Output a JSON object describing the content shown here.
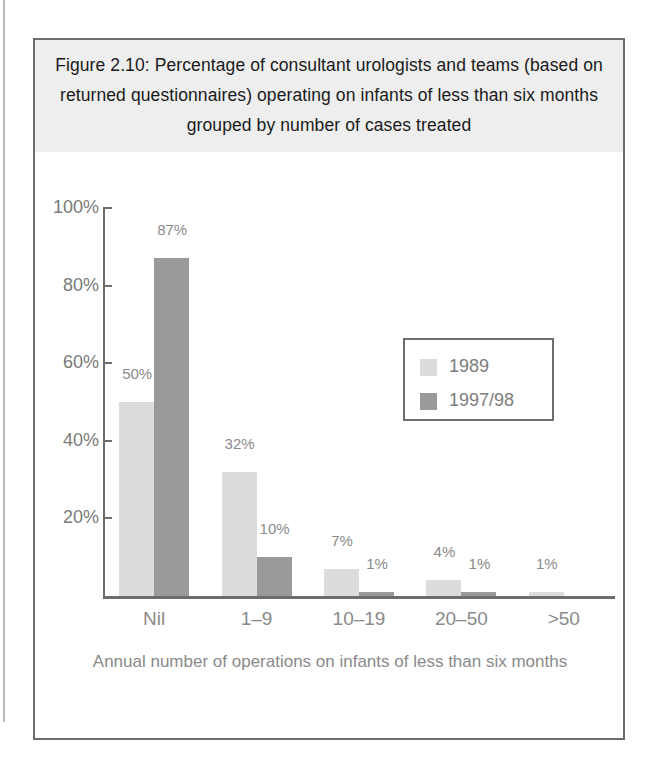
{
  "figure": {
    "title": "Figure 2.10: Percentage of consultant urologists and teams (based on returned questionnaires) operating on infants of less than six months grouped by number of cases treated"
  },
  "chart_data": {
    "type": "bar",
    "title": "Figure 2.10: Percentage of consultant urologists and teams (based on returned questionnaires) operating on infants of less than six months grouped by number of cases treated",
    "xlabel": "Annual number of operations on infants of less than six months",
    "ylabel": "",
    "ylim": [
      0,
      100
    ],
    "grid": false,
    "legend_position": "inside-upper-right",
    "categories": [
      "Nil",
      "1–9",
      "10–19",
      "20–50",
      ">50"
    ],
    "series": [
      {
        "name": "1989",
        "color": "#dcdcdc",
        "values": [
          50,
          32,
          7,
          4,
          1
        ],
        "labels": [
          "50%",
          "32%",
          "7%",
          "4%",
          "1%"
        ]
      },
      {
        "name": "1997/98",
        "color": "#9a9a9a",
        "values": [
          87,
          10,
          1,
          1,
          0
        ],
        "labels": [
          "87%",
          "10%",
          "1%",
          "1%",
          ""
        ]
      }
    ],
    "yticks": [
      20,
      40,
      60,
      80,
      100
    ],
    "ytick_labels": [
      "20%",
      "40%",
      "60%",
      "80%",
      "100%"
    ]
  },
  "axis": {
    "y_labels": [
      "100%",
      "80%",
      "60%",
      "40%",
      "20%"
    ],
    "x_title_line1": "Annual number of operations on infants of less than",
    "x_title_line2": "six months"
  },
  "legend": {
    "entries": [
      {
        "label": "1989",
        "color": "#dcdcdc"
      },
      {
        "label": "1997/98",
        "color": "#9a9a9a"
      }
    ]
  }
}
